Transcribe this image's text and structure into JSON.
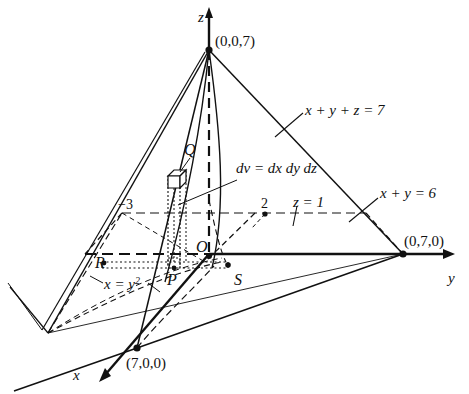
{
  "figure": {
    "background_color": "#ffffff",
    "line_color": "#111111"
  },
  "axes": [
    {
      "name": "z-axis",
      "label": "z"
    },
    {
      "name": "y-axis",
      "label": "y"
    },
    {
      "name": "x-axis",
      "label": "x"
    }
  ],
  "vertices": [
    {
      "name": "z-intercept",
      "label": "(0,0,7)"
    },
    {
      "name": "y-intercept",
      "label": "(0,7,0)"
    },
    {
      "name": "x-intercept",
      "label": "(7,0,0)"
    }
  ],
  "points": [
    {
      "name": "origin",
      "label": "O"
    },
    {
      "name": "point-p",
      "label": "P"
    },
    {
      "name": "point-q",
      "label": "Q"
    },
    {
      "name": "point-r",
      "label": "R"
    },
    {
      "name": "point-s",
      "label": "S"
    }
  ],
  "annotations": [
    {
      "name": "plane-equation",
      "label": "x + y + z = 7"
    },
    {
      "name": "volume-element",
      "label": "dv = dx dy dz"
    },
    {
      "name": "z-level",
      "label": "z = 1"
    },
    {
      "name": "line-xy6",
      "label": "x + y = 6"
    },
    {
      "name": "parabola-equation",
      "label": "x = y",
      "superscript": "2"
    }
  ],
  "tick_labels": [
    {
      "name": "tick-minus-three",
      "label": "−3"
    },
    {
      "name": "tick-two",
      "label": "2"
    }
  ]
}
